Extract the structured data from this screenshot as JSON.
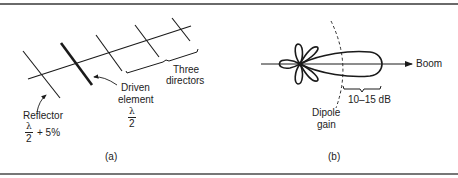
{
  "figure": {
    "panel_a": {
      "caption": "(a)",
      "labels": {
        "directors_line1": "Three",
        "directors_line2": "directors",
        "driven_line1": "Driven",
        "driven_line2": "element",
        "driven_frac_num": "λ",
        "driven_frac_den": "2",
        "reflector": "Reflector",
        "reflector_frac_num": "λ",
        "reflector_frac_den": "2",
        "reflector_suffix": "+ 5%"
      }
    },
    "panel_b": {
      "caption": "(b)",
      "labels": {
        "boom": "Boom",
        "gain_range": "10–15 dB",
        "dipole_line1": "Dipole",
        "dipole_line2": "gain"
      }
    },
    "colors": {
      "ink": "#1a1a1a",
      "rule": "#6a6a6a",
      "background": "#ffffff"
    }
  }
}
